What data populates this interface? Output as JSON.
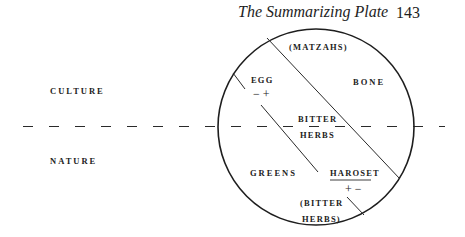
{
  "header": {
    "running_title": "The Summarizing Plate",
    "page_number": "143"
  },
  "diagram": {
    "axis_labels": {
      "upper": "CULTURE",
      "lower": "NATURE"
    },
    "plate_items": {
      "matzahs": "(MATZAHS)",
      "bone": "BONE",
      "egg": "EGG",
      "egg_signs": "− +",
      "bitter_herbs_line1": "BITTER",
      "bitter_herbs_line2": "HERBS",
      "greens": "GREENS",
      "haroset": "HAROSET",
      "haroset_signs": "+ −",
      "bitter_herbs_paren_line1": "(BITTER",
      "bitter_herbs_paren_line2": "HERBS)"
    },
    "colors": {
      "ink": "#222222",
      "background": "#ffffff"
    }
  }
}
